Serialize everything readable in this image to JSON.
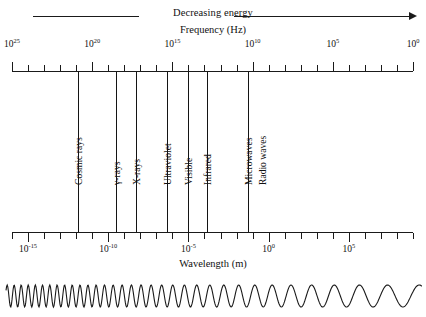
{
  "header": {
    "energy_label": "Decreasing energy",
    "energy_arrow_direction": "right"
  },
  "axes": {
    "frequency": {
      "title": "Frequency (Hz)",
      "unit": "Hz",
      "position": "top",
      "direction": "decreasing-left-to-right",
      "tick_labels": [
        "10",
        "10",
        "10",
        "10",
        "10",
        "10"
      ],
      "tick_exponents": [
        "25",
        "20",
        "15",
        "10",
        "5",
        "0"
      ],
      "tick_values": [
        1e+25,
        1e+20,
        1000000000000000.0,
        10000000000.0,
        100000.0,
        1
      ],
      "range": [
        1e+25,
        1
      ]
    },
    "wavelength": {
      "title": "Wavelength (m)",
      "unit": "m",
      "position": "bottom",
      "direction": "increasing-left-to-right",
      "tick_labels": [
        "10",
        "10",
        "10",
        "10",
        "10"
      ],
      "tick_exponents": [
        "-15",
        "-10",
        "-5",
        "0",
        "5"
      ],
      "tick_values": [
        1e-15,
        1e-10,
        1e-05,
        1,
        100000.0
      ],
      "range": [
        1e-16,
        10000000.0
      ]
    }
  },
  "bands": [
    {
      "name": "Cosmic rays"
    },
    {
      "name": "γ-rays"
    },
    {
      "name": "X-rays"
    },
    {
      "name": "Ultraviolet"
    },
    {
      "name": "Visible"
    },
    {
      "name": "Infrared"
    },
    {
      "name": "Microwaves"
    },
    {
      "name": "Radio waves"
    }
  ],
  "wave_illustration": {
    "description": "sine wave with wavelength increasing from left to right",
    "cycles": 26
  },
  "colors": {
    "ink": "#111111",
    "line": "#1a1a1a",
    "band_line": "#141414",
    "background": "#ffffff"
  },
  "chart_data": {
    "type": "diagram",
    "xlabel": "Frequency (Hz)",
    "ylabel": "",
    "grid": false,
    "legend": "none",
    "axis_top": {
      "label": "Frequency (Hz)",
      "ticks": [
        1e+25,
        1e+20,
        1000000000000000.0,
        10000000000.0,
        100000.0,
        1
      ],
      "tick_text": [
        "10^25",
        "10^20",
        "10^15",
        "10^10",
        "10^5",
        "10^0"
      ]
    },
    "axis_bottom": {
      "label": "Wavelength (m)",
      "ticks": [
        1e-15,
        1e-10,
        1e-05,
        1,
        100000.0
      ],
      "tick_text": [
        "10^-15",
        "10^-10",
        "10^-5",
        "10^0",
        "10^5"
      ]
    },
    "categories": [
      "Cosmic rays",
      "γ-rays",
      "X-rays",
      "Ultraviolet",
      "Visible",
      "Infrared",
      "Microwaves",
      "Radio waves"
    ],
    "annotations": [
      "Decreasing energy"
    ]
  }
}
